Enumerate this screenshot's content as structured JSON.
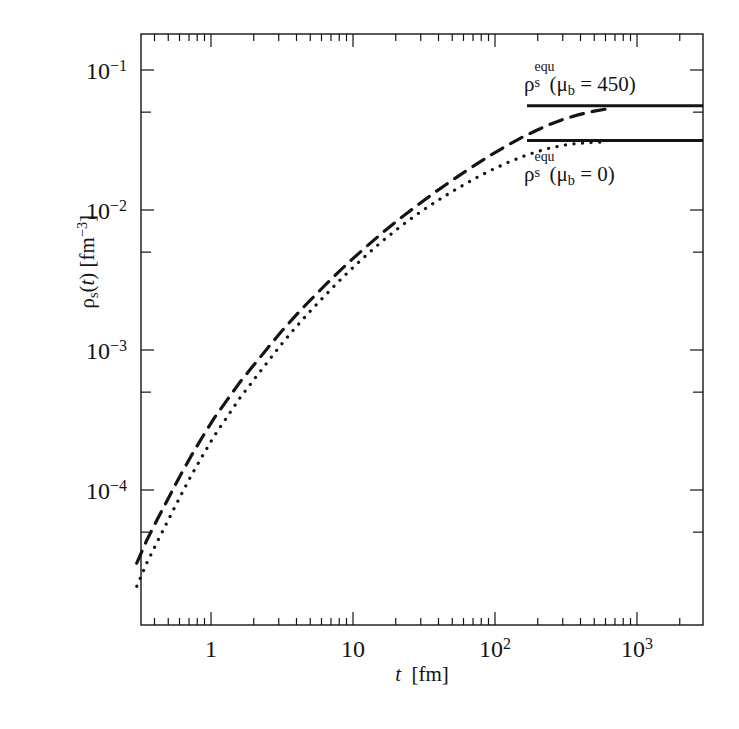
{
  "figure": {
    "background_color": "#ffffff",
    "line_color": "#141414",
    "frame": {
      "left": 141,
      "top": 34,
      "right": 703,
      "bottom": 625
    }
  },
  "axes": {
    "x": {
      "label_var": "t",
      "label_unit": "[fm]",
      "scale": "log",
      "min": 0.3,
      "max": 3000,
      "major_ticks": [
        1,
        10,
        100,
        1000
      ],
      "major_tick_labels": [
        "1",
        "10",
        "10²",
        "10³"
      ]
    },
    "y": {
      "label_var": "ρ",
      "label_sub": "s",
      "label_arg": "(t)",
      "label_unit": "[fm⁻³]",
      "scale": "log",
      "min": 3e-05,
      "max": 0.2,
      "major_ticks": [
        0.1,
        0.01,
        0.001,
        0.0001
      ],
      "major_tick_labels": [
        "10⁻¹",
        "10⁻²",
        "10⁻³",
        "10⁻⁴"
      ]
    }
  },
  "annotations": [
    {
      "name": "equilibrium-450",
      "rho": "ρ",
      "sup": "equ",
      "sub": "s",
      "arg": "(μ",
      "arg_sub": "b",
      "arg_rest": " = 450)",
      "text": "ρ_s^equ(μ_b = 450)",
      "x": 524,
      "y": 70
    },
    {
      "name": "equilibrium-0",
      "rho": "ρ",
      "sup": "equ",
      "sub": "s",
      "arg": "(μ",
      "arg_sub": "b",
      "arg_rest": " = 0)",
      "text": "ρ_s^equ(μ_b = 0)",
      "x": 524,
      "y": 160
    }
  ],
  "chart_data": {
    "type": "line",
    "title": "",
    "xlabel": "t  [fm]",
    "ylabel": "ρ_s(t) [fm^-3]",
    "xscale": "log",
    "yscale": "log",
    "xlim": [
      0.3,
      3000
    ],
    "ylim": [
      3e-05,
      0.2
    ],
    "grid": false,
    "legend_position": "inside-right",
    "series": [
      {
        "name": "ρ_s(t) for μ_b = 450 MeV",
        "style": "dashed",
        "color": "#141414",
        "saturation_value": 0.055,
        "x": [
          0.3,
          0.35,
          0.42,
          0.5,
          0.6,
          0.72,
          0.87,
          1.05,
          1.3,
          1.6,
          2.0,
          2.5,
          3.1,
          3.9,
          4.9,
          6.2,
          7.8,
          9.8,
          12.3,
          15.5,
          19.5,
          24.5,
          31.0,
          39.0,
          49.0,
          62.0,
          78.0,
          98.0,
          123.0,
          155.0,
          195.0,
          245.0,
          310.0,
          390.0,
          490.0,
          600.0
        ],
        "y": [
          3e-05,
          4.3e-05,
          6.2e-05,
          8.7e-05,
          0.000124,
          0.000173,
          0.000239,
          0.000325,
          0.00044,
          0.00059,
          0.00078,
          0.00103,
          0.00134,
          0.00174,
          0.00222,
          0.00283,
          0.00356,
          0.00442,
          0.00543,
          0.00665,
          0.00805,
          0.00965,
          0.01155,
          0.0137,
          0.0161,
          0.0189,
          0.022,
          0.0254,
          0.0291,
          0.033,
          0.037,
          0.041,
          0.0448,
          0.048,
          0.0506,
          0.0525
        ]
      },
      {
        "name": "ρ_s(t) for μ_b = 0",
        "style": "dotted",
        "color": "#141414",
        "saturation_value": 0.031,
        "x": [
          0.3,
          0.35,
          0.42,
          0.5,
          0.6,
          0.72,
          0.87,
          1.05,
          1.3,
          1.6,
          2.0,
          2.5,
          3.1,
          3.9,
          4.9,
          6.2,
          7.8,
          9.8,
          12.3,
          15.5,
          19.5,
          24.5,
          31.0,
          39.0,
          49.0,
          62.0,
          78.0,
          98.0,
          123.0,
          155.0,
          195.0,
          245.0,
          310.0,
          390.0,
          490.0,
          600.0
        ],
        "y": [
          2.05e-05,
          2.96e-05,
          4.3e-05,
          6.1e-05,
          8.8e-05,
          0.000125,
          0.000175,
          0.000242,
          0.000333,
          0.000455,
          0.000612,
          0.00082,
          0.001085,
          0.00143,
          0.001855,
          0.00239,
          0.00304,
          0.00381,
          0.00472,
          0.0058,
          0.00702,
          0.0084,
          0.00995,
          0.0116,
          0.0134,
          0.0154,
          0.0175,
          0.01965,
          0.02185,
          0.024,
          0.026,
          0.02775,
          0.0291,
          0.02995,
          0.0304,
          0.0306
        ]
      },
      {
        "name": "ρ_s^equ(μ_b = 450)",
        "style": "solid",
        "color": "#141414",
        "type": "horizontal-reference",
        "value": 0.0555,
        "x_start": 527,
        "x_end": 703
      },
      {
        "name": "ρ_s^equ(μ_b = 0)",
        "style": "solid",
        "color": "#141414",
        "type": "horizontal-reference",
        "value": 0.0313,
        "x_start": 527,
        "x_end": 703
      }
    ]
  }
}
